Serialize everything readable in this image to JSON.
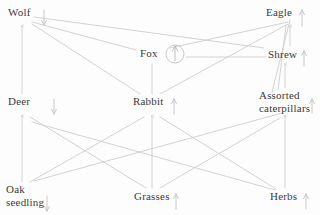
{
  "diagram": {
    "background_color": "#fdfdfd",
    "label_color": "#3a3a3a",
    "edge_color": "#c9c9c9",
    "highlight_circle_color": "#c4c4c4"
  },
  "nodes": [
    {
      "id": "wolf",
      "label": "Wolf",
      "x": 8,
      "y": 8,
      "trophic": "tertiary-consumer"
    },
    {
      "id": "eagle",
      "label": "Eagle",
      "x": 266,
      "y": 8,
      "trophic": "tertiary-consumer"
    },
    {
      "id": "fox",
      "label": "Fox",
      "x": 140,
      "y": 49,
      "trophic": "secondary-consumer"
    },
    {
      "id": "shrew",
      "label": "Shrew",
      "x": 268,
      "y": 50,
      "trophic": "secondary-consumer"
    },
    {
      "id": "deer",
      "label": "Deer",
      "x": 8,
      "y": 97,
      "trophic": "primary-consumer"
    },
    {
      "id": "rabbit",
      "label": "Rabbit",
      "x": 133,
      "y": 97,
      "trophic": "primary-consumer"
    },
    {
      "id": "caterpillars",
      "label": "Assorted\ncaterpillars",
      "x": 259,
      "y": 91,
      "trophic": "primary-consumer"
    },
    {
      "id": "oak",
      "label": "Oak\nseedling",
      "x": 6,
      "y": 185,
      "trophic": "producer"
    },
    {
      "id": "grasses",
      "label": "Grasses",
      "x": 134,
      "y": 192,
      "trophic": "producer"
    },
    {
      "id": "herbs",
      "label": "Herbs",
      "x": 270,
      "y": 192,
      "trophic": "producer"
    }
  ],
  "edges": [
    {
      "from": "deer",
      "to": "wolf",
      "style": "vertical",
      "arrow": "up"
    },
    {
      "from": "rabbit",
      "to": "wolf",
      "style": "diagonal",
      "arrow": "none"
    },
    {
      "from": "fox",
      "to": "wolf",
      "style": "diagonal",
      "arrow": "none"
    },
    {
      "from": "shrew",
      "to": "wolf",
      "style": "diagonal",
      "arrow": "none"
    },
    {
      "from": "rabbit",
      "to": "eagle",
      "style": "diagonal",
      "arrow": "none"
    },
    {
      "from": "fox",
      "to": "eagle",
      "style": "diagonal",
      "arrow": "none"
    },
    {
      "from": "shrew",
      "to": "eagle",
      "style": "vertical",
      "arrow": "up"
    },
    {
      "from": "caterpillars",
      "to": "eagle",
      "style": "diagonal",
      "arrow": "none"
    },
    {
      "from": "rabbit",
      "to": "fox",
      "style": "vertical",
      "arrow": "up"
    },
    {
      "from": "shrew",
      "to": "fox",
      "style": "horizontal",
      "arrow": "left-circled"
    },
    {
      "from": "caterpillars",
      "to": "shrew",
      "style": "vertical",
      "arrow": "up"
    },
    {
      "from": "oak",
      "to": "deer",
      "style": "vertical",
      "arrow": "up"
    },
    {
      "from": "grasses",
      "to": "deer",
      "style": "diagonal",
      "arrow": "none"
    },
    {
      "from": "herbs",
      "to": "deer",
      "style": "diagonal",
      "arrow": "none"
    },
    {
      "from": "oak",
      "to": "rabbit",
      "style": "diagonal",
      "arrow": "none"
    },
    {
      "from": "grasses",
      "to": "rabbit",
      "style": "vertical",
      "arrow": "up"
    },
    {
      "from": "herbs",
      "to": "rabbit",
      "style": "diagonal",
      "arrow": "none"
    },
    {
      "from": "oak",
      "to": "caterpillars",
      "style": "diagonal",
      "arrow": "none"
    },
    {
      "from": "grasses",
      "to": "caterpillars",
      "style": "diagonal",
      "arrow": "none"
    },
    {
      "from": "herbs",
      "to": "caterpillars",
      "style": "vertical",
      "arrow": "up"
    }
  ],
  "highlight": {
    "target_edge": "rabbit-to-fox",
    "shape": "circle",
    "center_x": 175,
    "center_y": 54,
    "radius": 9
  }
}
